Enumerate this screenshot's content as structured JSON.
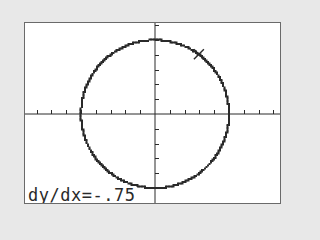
{
  "screen": {
    "mode": "graph",
    "background": "#ffffff",
    "border_color": "#6a6a6a",
    "ink_color": "#2a2a2a"
  },
  "graph": {
    "equation_implied": "x^2 + y^2 = 25",
    "curve": "circle",
    "center": [
      0,
      0
    ],
    "radius": 5,
    "window": {
      "xmin": -8.2,
      "xmax": 8.7,
      "ymin": -6.1,
      "ymax": 6.1,
      "xscl": 1,
      "yscl": 1
    },
    "trace_cursor": {
      "icon": "x-cursor-icon",
      "x": 3,
      "y": 4
    }
  },
  "readout": {
    "label": "dy/dx=",
    "value": "-.75",
    "text": "dy/dx=-.75"
  },
  "chart_data": {
    "type": "line",
    "title": "",
    "xlabel": "",
    "ylabel": "",
    "series": [
      {
        "name": "circle x^2+y^2=25",
        "shape": "circle",
        "center": [
          0,
          0
        ],
        "radius": 5
      }
    ],
    "marker": {
      "x": 3,
      "y": 4,
      "symbol": "X"
    },
    "annotation": "dy/dx=-.75",
    "xlim": [
      -8.2,
      8.7
    ],
    "ylim": [
      -6.1,
      6.1
    ],
    "grid": false,
    "ticks": {
      "x_spacing": 1,
      "y_spacing": 1
    }
  }
}
